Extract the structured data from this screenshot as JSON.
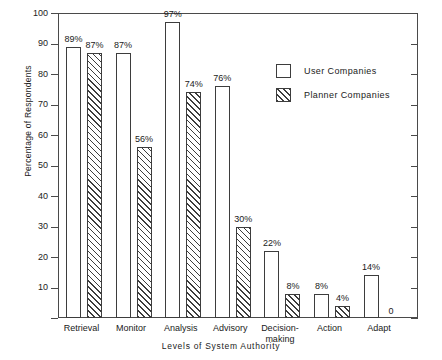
{
  "chart_data": {
    "type": "bar",
    "title": "",
    "xlabel": "Levels of System Authority",
    "ylabel": "Percentage of Respondents",
    "categories": [
      "Retrieval",
      "Monitor",
      "Analysis",
      "Advisory",
      "Decision-\nmaking",
      "Action",
      "Adapt"
    ],
    "series": [
      {
        "name": "User Companies",
        "style": "open",
        "values": [
          89,
          87,
          97,
          76,
          22,
          8,
          14
        ],
        "labels": [
          "89%",
          "87%",
          "97%",
          "76%",
          "22%",
          "8%",
          "14%"
        ]
      },
      {
        "name": "Planner Companies",
        "style": "hatched",
        "values": [
          87,
          56,
          74,
          30,
          8,
          4,
          0
        ],
        "labels": [
          "87%",
          "56%",
          "74%",
          "30%",
          "8%",
          "4%",
          "0"
        ]
      }
    ],
    "ylim": [
      0,
      100
    ],
    "yticks": [
      0,
      10,
      20,
      30,
      40,
      50,
      60,
      70,
      80,
      90,
      100
    ],
    "ytick_labels": [
      "",
      "10",
      "20",
      "30",
      "40",
      "50",
      "60",
      "70",
      "80",
      "90",
      "100"
    ],
    "grid": false,
    "legend_position": "upper right",
    "right_axis_ticks": true,
    "axis_color": "#4a4a4a",
    "bar_edge_color": "#3d3d3d",
    "bar_fill_color": "#ffffff"
  },
  "legend": {
    "items": [
      {
        "label": "User Companies",
        "style": "open"
      },
      {
        "label": "Planner Companies",
        "style": "hatched"
      }
    ]
  }
}
